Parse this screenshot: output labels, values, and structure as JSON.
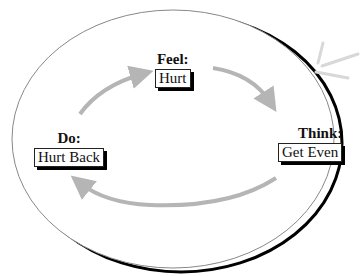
{
  "diagram": {
    "type": "cycle",
    "nodes": [
      {
        "id": "feel",
        "label": "Feel:",
        "value": "Hurt"
      },
      {
        "id": "think",
        "label": "Think:",
        "value": "Get Even"
      },
      {
        "id": "do",
        "label": "Do:",
        "value": "Hurt Back"
      }
    ],
    "edges": [
      {
        "from": "do",
        "to": "feel"
      },
      {
        "from": "feel",
        "to": "think"
      },
      {
        "from": "think",
        "to": "do"
      }
    ],
    "colors": {
      "arrow": "#b5b5b5",
      "ellipse_outline": "#888888",
      "ellipse_shadow": "#000000",
      "box_shadow": "#000000"
    }
  }
}
